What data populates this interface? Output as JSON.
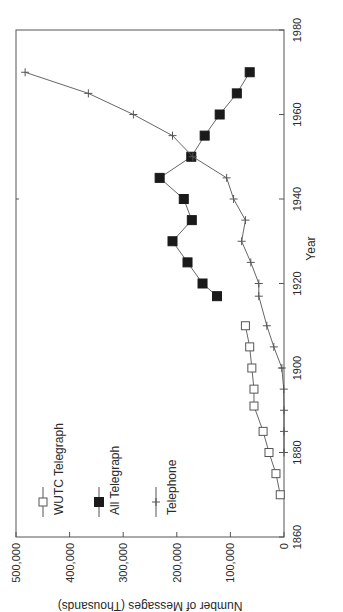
{
  "chart_data": {
    "type": "line",
    "orientation": "rotated-90-ccw",
    "title": "",
    "xlabel": "Year",
    "ylabel": "Number of Messages (Thousands)",
    "xlim": [
      1860,
      1980
    ],
    "ylim": [
      0,
      500000
    ],
    "x_ticks": [
      "1860",
      "1880",
      "1900",
      "1920",
      "1940",
      "1960",
      "1980"
    ],
    "y_ticks": [
      "0",
      "100,000",
      "200,000",
      "300,000",
      "400,000",
      "500,000"
    ],
    "grid": false,
    "legend_position": "upper-left (inside plot)",
    "series": [
      {
        "name": "WUTC Telegraph",
        "marker": "open-square",
        "x": [
          1870,
          1875,
          1880,
          1885,
          1891,
          1895,
          1900,
          1905,
          1910
        ],
        "values": [
          7000,
          15000,
          28000,
          39000,
          56000,
          56000,
          60000,
          64000,
          72000
        ]
      },
      {
        "name": "All Telegraph",
        "marker": "filled-square",
        "x": [
          1917,
          1920,
          1925,
          1930,
          1935,
          1940,
          1945,
          1950,
          1955,
          1960,
          1965,
          1970
        ],
        "values": [
          125000,
          152000,
          180000,
          208000,
          172000,
          187000,
          232000,
          173000,
          148000,
          120000,
          88000,
          64000
        ]
      },
      {
        "name": "Telephone",
        "marker": "plus",
        "x": [
          1880,
          1885,
          1890,
          1895,
          1900,
          1905,
          1910,
          1917,
          1920,
          1925,
          1930,
          1935,
          1940,
          1945,
          1950,
          1955,
          1960,
          1965,
          1970
        ],
        "values": [
          0,
          0,
          0,
          500,
          4000,
          19000,
          32000,
          47000,
          47000,
          62000,
          79000,
          72000,
          94000,
          107000,
          170000,
          208000,
          281000,
          365000,
          483000
        ]
      }
    ]
  },
  "legend": {
    "items": [
      {
        "label": "WUTC Telegraph",
        "marker": "open-square"
      },
      {
        "label": "All Telegraph",
        "marker": "filled-square"
      },
      {
        "label": "Telephone",
        "marker": "plus"
      }
    ]
  },
  "colors": {
    "line": "#555555",
    "marker_fill": "#1a1a1a",
    "text": "#2a2a2a",
    "background": "#ffffff"
  }
}
